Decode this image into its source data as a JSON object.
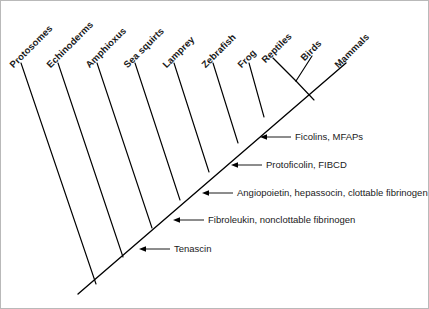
{
  "figure": {
    "type": "cladogram",
    "background_color": "#ffffff",
    "line_color": "#000000",
    "text_color": "#1a1a1a",
    "border_color": "#b9b9b9",
    "width": 429,
    "height": 309
  },
  "taxa": [
    {
      "label": "Protosomes",
      "tip_x": 20,
      "tip_y": 62,
      "base_x": 95,
      "base_y": 283,
      "label_x": 14,
      "label_y": 58,
      "angle": -45
    },
    {
      "label": "Echinoderms",
      "tip_x": 57,
      "tip_y": 62,
      "base_x": 122,
      "base_y": 256,
      "label_x": 51,
      "label_y": 58,
      "angle": -45
    },
    {
      "label": "Amphioxus",
      "tip_x": 96,
      "tip_y": 62,
      "base_x": 151,
      "base_y": 227,
      "label_x": 90,
      "label_y": 58,
      "angle": -45
    },
    {
      "label": "Sea squirts",
      "tip_x": 134,
      "tip_y": 62,
      "base_x": 179,
      "base_y": 199,
      "label_x": 128,
      "label_y": 58,
      "angle": -45
    },
    {
      "label": "Lamprey",
      "tip_x": 173,
      "tip_y": 62,
      "base_x": 208,
      "base_y": 171,
      "label_x": 167,
      "label_y": 58,
      "angle": -45
    },
    {
      "label": "Zebrafish",
      "tip_x": 212,
      "tip_y": 62,
      "base_x": 237,
      "base_y": 142,
      "label_x": 206,
      "label_y": 58,
      "angle": -45
    },
    {
      "label": "Frog",
      "tip_x": 248,
      "tip_y": 62,
      "base_x": 263,
      "base_y": 116,
      "label_x": 242,
      "label_y": 58,
      "angle": -45
    },
    {
      "label": "Reptiles",
      "tip_x": 272,
      "tip_y": 57,
      "base_x": 295,
      "base_y": 80,
      "label_x": 266,
      "label_y": 53,
      "angle": -45
    },
    {
      "label": "Birds",
      "tip_x": 311,
      "tip_y": 55,
      "base_x": 295,
      "base_y": 80,
      "label_x": 305,
      "label_y": 51,
      "angle": -45
    },
    {
      "label": "Mammals",
      "tip_x": 345,
      "tip_y": 62,
      "base_x": 345,
      "base_y": 62,
      "label_x": 339,
      "label_y": 58,
      "angle": -45
    }
  ],
  "backbone": {
    "root_x": 77,
    "root_y": 293,
    "tip_x": 345,
    "tip_y": 62
  },
  "amniote_fork": {
    "node_x": 295,
    "node_y": 80,
    "stem_base_x": 313,
    "stem_base_y": 99
  },
  "annotations": [
    {
      "text": "Ficolins, MFAPs",
      "arrow_tip_x": 259,
      "arrow_tip_y": 136,
      "line_end_x": 290,
      "line_end_y": 136,
      "label_x": 294,
      "label_y": 130
    },
    {
      "text": "Protoficolin, FIBCD",
      "arrow_tip_x": 230,
      "arrow_tip_y": 164,
      "line_end_x": 261,
      "line_end_y": 164,
      "label_x": 265,
      "label_y": 158
    },
    {
      "text": "Angiopoietin, hepassocin, clottable fibrinogen",
      "arrow_tip_x": 201,
      "arrow_tip_y": 192,
      "line_end_x": 232,
      "line_end_y": 192,
      "label_x": 236,
      "label_y": 186
    },
    {
      "text": "Fibroleukin, nonclottable fibrinogen",
      "arrow_tip_x": 172,
      "arrow_tip_y": 219,
      "line_end_x": 203,
      "line_end_y": 219,
      "label_x": 207,
      "label_y": 213
    },
    {
      "text": "Tenascin",
      "arrow_tip_x": 138,
      "arrow_tip_y": 248,
      "line_end_x": 169,
      "line_end_y": 248,
      "label_x": 173,
      "label_y": 242
    }
  ],
  "chart_data": {
    "type": "diagram",
    "title": "",
    "taxa_order": [
      "Protosomes",
      "Echinoderms",
      "Amphioxus",
      "Sea squirts",
      "Lamprey",
      "Zebrafish",
      "Frog",
      "Reptiles",
      "Birds",
      "Mammals"
    ],
    "annotation_texts": [
      "Ficolins, MFAPs",
      "Protoficolin, FIBCD",
      "Angiopoietin, hepassocin, clottable fibrinogen",
      "Fibroleukin, nonclottable fibrinogen",
      "Tenascin"
    ]
  }
}
